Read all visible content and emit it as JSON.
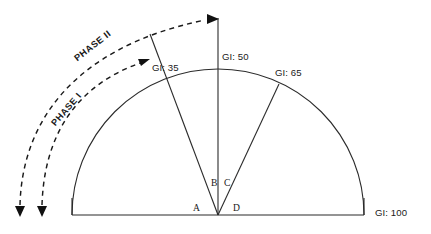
{
  "diagram": {
    "type": "semicircle-gi-phase-diagram",
    "background_color": "#ffffff",
    "line_color": "#2b2b2b",
    "dashed_line_color": "#1a1a1a",
    "geometry": {
      "center_x": 218,
      "center_y": 215,
      "radius": 145,
      "baseline_left_x": 72,
      "baseline_right_x": 363,
      "baseline_y": 215,
      "arc_top_y": 70
    },
    "gi_labels": [
      {
        "id": "gi-35",
        "text": "GI: 35",
        "value": 35,
        "angle_deg": 125
      },
      {
        "id": "gi-50",
        "text": "GI: 50",
        "value": 50,
        "angle_deg": 90
      },
      {
        "id": "gi-65",
        "text": "GI: 65",
        "value": 65,
        "angle_deg": 58
      },
      {
        "id": "gi-100",
        "text": "GI: 100",
        "value": 100,
        "angle_deg": 0
      }
    ],
    "point_labels": [
      {
        "id": "point-a",
        "text": "A"
      },
      {
        "id": "point-b",
        "text": "B"
      },
      {
        "id": "point-c",
        "text": "C"
      },
      {
        "id": "point-d",
        "text": "D"
      }
    ],
    "phase_labels": [
      {
        "id": "phase-1",
        "text": "PHASE I",
        "rotation_deg": -49
      },
      {
        "id": "phase-2",
        "text": "PHASE II",
        "rotation_deg": -38
      }
    ]
  }
}
